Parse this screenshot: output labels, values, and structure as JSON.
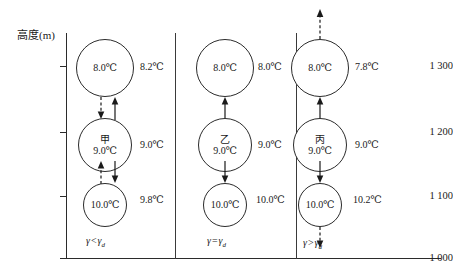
{
  "figure": {
    "axis": {
      "y_title": "高度(m)",
      "y_ticks": [
        {
          "label": "1 300",
          "value": 1300
        },
        {
          "label": "1 200",
          "value": 1200
        },
        {
          "label": "1 100",
          "value": 1100
        },
        {
          "label": "1 000",
          "value": 1000
        }
      ]
    },
    "panels": [
      {
        "id": "panel-1",
        "gamma_caption": {
          "symbol": "γ",
          "operator": "<",
          "symbol2": "γ",
          "sub": "d",
          "full": "γ<γd"
        },
        "parcels": [
          {
            "name": "",
            "temp": "8.0℃",
            "level": 1300
          },
          {
            "name": "甲",
            "temp": "9.0℃",
            "level": 1200
          },
          {
            "name": "",
            "temp": "10.0℃",
            "level": 1100
          }
        ],
        "env_temps": [
          "8.2℃",
          "9.0℃",
          "9.8℃"
        ],
        "arrows": [
          {
            "id": "p1-top-dashed-down",
            "style": "dashed",
            "direction": "down"
          },
          {
            "id": "p1-top-solid-up",
            "style": "solid",
            "direction": "up"
          },
          {
            "id": "p1-bottom-dashed-up",
            "style": "dashed",
            "direction": "up"
          },
          {
            "id": "p1-bottom-solid-down",
            "style": "solid",
            "direction": "down"
          }
        ]
      },
      {
        "id": "panel-2",
        "gamma_caption": {
          "symbol": "γ",
          "operator": "=",
          "symbol2": "γ",
          "sub": "d",
          "full": "γ=γd"
        },
        "parcels": [
          {
            "name": "",
            "temp": "8.0℃",
            "level": 1300
          },
          {
            "name": "乙",
            "temp": "9.0℃",
            "level": 1200
          },
          {
            "name": "",
            "temp": "10.0℃",
            "level": 1100
          }
        ],
        "env_temps": [
          "8.0℃",
          "9.0℃",
          "10.0℃"
        ],
        "arrows": [
          {
            "id": "p2-top-solid-up",
            "style": "solid",
            "direction": "up"
          },
          {
            "id": "p2-bottom-solid-down",
            "style": "solid",
            "direction": "down"
          }
        ]
      },
      {
        "id": "panel-3",
        "gamma_caption": {
          "symbol": "γ",
          "operator": ">",
          "symbol2": "γ",
          "sub": "d",
          "full": "γ>γd"
        },
        "parcels": [
          {
            "name": "",
            "temp": "8.0℃",
            "level": 1300
          },
          {
            "name": "丙",
            "temp": "9.0℃",
            "level": 1200
          },
          {
            "name": "",
            "temp": "10.0℃",
            "level": 1100
          }
        ],
        "env_temps": [
          "7.8℃",
          "9.0℃",
          "10.2℃"
        ],
        "arrows": [
          {
            "id": "p3-above-dashed-up",
            "style": "dashed",
            "direction": "up"
          },
          {
            "id": "p3-top-solid-up",
            "style": "solid",
            "direction": "up"
          },
          {
            "id": "p3-bottom-solid-down",
            "style": "solid",
            "direction": "down"
          },
          {
            "id": "p3-below-dashed-down",
            "style": "dashed",
            "direction": "down"
          }
        ]
      }
    ]
  }
}
